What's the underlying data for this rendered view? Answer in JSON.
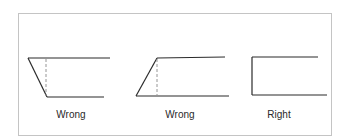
{
  "figure": {
    "frame": {
      "x": 18,
      "y": 13,
      "width": 313,
      "height": 122,
      "stroke": "#c4c4c4"
    },
    "line_color": "#2b2b2b",
    "dash_color": "#8a8a8a",
    "panels": [
      {
        "label": "Wrong",
        "label_x": 71,
        "label_y": 118,
        "top": {
          "x1": 28,
          "y1": 58,
          "x2": 110,
          "y2": 58
        },
        "side": {
          "x1": 28,
          "y1": 58,
          "x2": 47,
          "y2": 97
        },
        "bottom": {
          "x1": 47,
          "y1": 97,
          "x2": 104,
          "y2": 97
        },
        "guide": {
          "x1": 46,
          "y1": 59,
          "x2": 46,
          "y2": 96
        }
      },
      {
        "label": "Wrong",
        "label_x": 180,
        "label_y": 118,
        "top": {
          "x1": 157,
          "y1": 58,
          "x2": 225,
          "y2": 57
        },
        "side": {
          "x1": 136,
          "y1": 96,
          "x2": 157,
          "y2": 58
        },
        "bottom": {
          "x1": 136,
          "y1": 96,
          "x2": 229,
          "y2": 96
        },
        "guide": {
          "x1": 157,
          "y1": 59,
          "x2": 157,
          "y2": 95
        }
      },
      {
        "label": "Right",
        "label_x": 279,
        "label_y": 118,
        "top": {
          "x1": 252,
          "y1": 57,
          "x2": 318,
          "y2": 57
        },
        "side": {
          "x1": 252,
          "y1": 57,
          "x2": 252,
          "y2": 95
        },
        "bottom": {
          "x1": 252,
          "y1": 95,
          "x2": 327,
          "y2": 95
        },
        "guide": null
      }
    ]
  }
}
